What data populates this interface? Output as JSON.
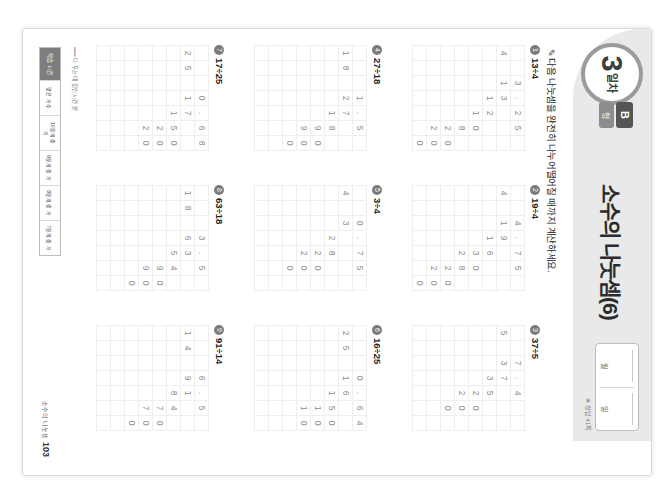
{
  "worksheet": {
    "day_number": "3",
    "day_suffix": "일차",
    "tab_letter": "B",
    "tab_sub": "형",
    "title": "소수의 나눗셈(6)",
    "date_labels": {
      "month": "월",
      "day": "일",
      "name": "이름",
      "blank": ""
    },
    "answer_note": "※ 정답 41쪽",
    "instruction": "다음 나눗셈을 완전히 나누어떨어질 때까지 계산하세요.",
    "pen_icon": "pencil-icon",
    "page_label_kr": "소수의 나눗셈",
    "page_number": "103",
    "footer_title": "••••• 다 푸는 데 걸린 시간 분",
    "footer_header": "학습 시간",
    "footer_cells": [
      "맞은 개수",
      "10문제 중\n개",
      "9문제 중\n개",
      "8문제 중\n개",
      "7문제 중\n개"
    ]
  },
  "problems": [
    {
      "id": "p1",
      "num": "①",
      "expr": "13÷4",
      "quotient": [
        "3",
        ".",
        "2",
        "5"
      ],
      "divisor": "4",
      "dividend": [
        "1",
        "3"
      ],
      "work_rows": [
        [
          "",
          "1",
          "2",
          "",
          ""
        ],
        [
          "",
          "",
          "1",
          "0",
          ""
        ],
        [
          "",
          "",
          "",
          "8",
          ""
        ],
        [
          "",
          "",
          "",
          "2",
          "0"
        ],
        [
          "",
          "",
          "",
          "2",
          "0"
        ],
        [
          "",
          "",
          "",
          "",
          "0"
        ]
      ]
    },
    {
      "id": "p2",
      "num": "②",
      "expr": "19÷4",
      "quotient": [
        "4",
        ".",
        "7",
        "5"
      ],
      "divisor": "4",
      "dividend": [
        "1",
        "9"
      ],
      "work_rows": [
        [
          "",
          "1",
          "6",
          "",
          ""
        ],
        [
          "",
          "",
          "3",
          "0",
          ""
        ],
        [
          "",
          "",
          "2",
          "8",
          ""
        ],
        [
          "",
          "",
          "",
          "2",
          "0"
        ],
        [
          "",
          "",
          "",
          "2",
          "0"
        ],
        [
          "",
          "",
          "",
          "",
          "0"
        ]
      ]
    },
    {
      "id": "p3",
      "num": "③",
      "expr": "37÷5",
      "quotient": [
        "7",
        ".",
        "4"
      ],
      "divisor": "5",
      "dividend": [
        "3",
        "7"
      ],
      "work_rows": [
        [
          "",
          "3",
          "5",
          "",
          ""
        ],
        [
          "",
          "",
          "2",
          "0",
          ""
        ],
        [
          "",
          "",
          "2",
          "0",
          ""
        ],
        [
          "",
          "",
          "",
          "0",
          ""
        ]
      ]
    },
    {
      "id": "p4",
      "num": "④",
      "expr": "27÷18",
      "quotient": [
        "1",
        ".",
        "5"
      ],
      "divisor": "18",
      "dividend": [
        "2",
        "7"
      ],
      "work_rows": [
        [
          "",
          "1",
          "8",
          "",
          ""
        ],
        [
          "",
          "",
          "9",
          "0",
          ""
        ],
        [
          "",
          "",
          "9",
          "0",
          ""
        ],
        [
          "",
          "",
          "",
          "0",
          ""
        ]
      ]
    },
    {
      "id": "p5",
      "num": "⑤",
      "expr": "3÷4",
      "quotient": [
        "0",
        ".",
        "7",
        "5"
      ],
      "divisor": "4",
      "dividend": [
        "3"
      ],
      "work_rows": [
        [
          "",
          "2",
          "8",
          "",
          ""
        ],
        [
          "",
          "",
          "2",
          "0",
          ""
        ],
        [
          "",
          "",
          "2",
          "0",
          ""
        ],
        [
          "",
          "",
          "",
          "0",
          ""
        ]
      ]
    },
    {
      "id": "p6",
      "num": "⑥",
      "expr": "16÷25",
      "quotient": [
        "0",
        ".",
        "6",
        "4"
      ],
      "divisor": "25",
      "dividend": [
        "1",
        "6"
      ],
      "work_rows": [
        [
          "",
          "1",
          "5",
          "0",
          ""
        ],
        [
          "",
          "",
          "1",
          "0",
          "0"
        ],
        [
          "",
          "",
          "1",
          "0",
          "0"
        ],
        [
          "",
          "",
          "",
          "",
          "0"
        ]
      ]
    },
    {
      "id": "p7",
      "num": "⑦",
      "expr": "17÷25",
      "quotient": [
        "0",
        ".",
        "6",
        "8"
      ],
      "divisor": "25",
      "dividend": [
        "1",
        "7"
      ],
      "work_rows": [
        [
          "",
          "1",
          "5",
          "0",
          ""
        ],
        [
          "",
          "",
          "2",
          "0",
          "0"
        ],
        [
          "",
          "",
          "2",
          "0",
          "0"
        ],
        [
          "",
          "",
          "",
          "",
          "0"
        ]
      ]
    },
    {
      "id": "p8",
      "num": "⑧",
      "expr": "63÷18",
      "quotient": [
        "3",
        ".",
        "5"
      ],
      "divisor": "18",
      "dividend": [
        "6",
        "3"
      ],
      "work_rows": [
        [
          "",
          "5",
          "4",
          "",
          ""
        ],
        [
          "",
          "",
          "9",
          "0",
          ""
        ],
        [
          "",
          "",
          "9",
          "0",
          ""
        ],
        [
          "",
          "",
          "",
          "0",
          ""
        ]
      ]
    },
    {
      "id": "p9",
      "num": "⑨",
      "expr": "91÷14",
      "quotient": [
        "6",
        ".",
        "5"
      ],
      "divisor": "14",
      "dividend": [
        "9",
        "1"
      ],
      "work_rows": [
        [
          "",
          "8",
          "4",
          "",
          ""
        ],
        [
          "",
          "",
          "7",
          "0",
          ""
        ],
        [
          "",
          "",
          "7",
          "0",
          ""
        ],
        [
          "",
          "",
          "",
          "0",
          ""
        ]
      ]
    }
  ]
}
